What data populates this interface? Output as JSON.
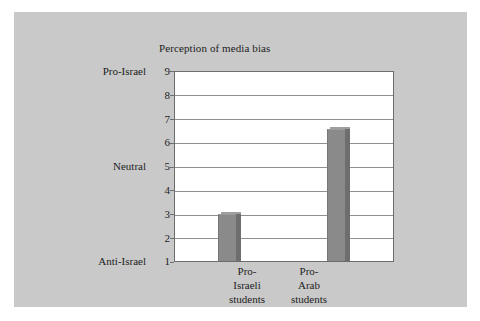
{
  "chart_data": {
    "type": "bar",
    "title": "Perception of media bias",
    "xlabel": "",
    "ylabel": "",
    "categories": [
      "Pro-Israeli students",
      "Pro-Arab students"
    ],
    "category_lines": [
      [
        "Pro-",
        "Israeli",
        "students"
      ],
      [
        "Pro-",
        "Arab",
        "students"
      ]
    ],
    "values": [
      3,
      6.6
    ],
    "ylim": [
      1,
      9
    ],
    "yticks": [
      1,
      2,
      3,
      4,
      5,
      6,
      7,
      8,
      9
    ],
    "ytick_labels": [
      "1",
      "2",
      "3",
      "4",
      "5",
      "6",
      "7",
      "8",
      "9"
    ],
    "y_anchor_labels": [
      {
        "value": 9,
        "label": "Pro-Israel"
      },
      {
        "value": 5,
        "label": "Neutral"
      },
      {
        "value": 1,
        "label": "Anti-Israel"
      }
    ],
    "grid": true,
    "legend": false,
    "bar_color": "#8a8a8a",
    "bar_side_color": "#6e6e6e",
    "plot_background": "#ffffff",
    "figure_background": "#c9c9c9"
  }
}
